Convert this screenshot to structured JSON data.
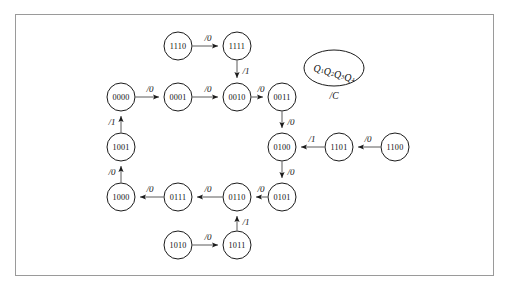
{
  "figure": {
    "type": "state-transition-diagram",
    "border_color": "#9a9a9a",
    "node_stroke": "#1b1b1b",
    "edge_stroke": "#5b5b5b",
    "background": "#ffffff"
  },
  "legend": {
    "state_var_base": "Q",
    "state_var_subscripts": [
      "1",
      "2",
      "3",
      "4"
    ],
    "state_var_label": "Q1Q2Q3Q4",
    "output_label": "/C"
  },
  "nodes": [
    {
      "id": "1110",
      "label": "1110",
      "cx": 178,
      "cy": 46,
      "r": 14
    },
    {
      "id": "1111",
      "label": "1111",
      "cx": 237,
      "cy": 46,
      "r": 14
    },
    {
      "id": "0000",
      "label": "0000",
      "cx": 121,
      "cy": 97,
      "r": 14
    },
    {
      "id": "0001",
      "label": "0001",
      "cx": 178,
      "cy": 97,
      "r": 14
    },
    {
      "id": "0010",
      "label": "0010",
      "cx": 237,
      "cy": 97,
      "r": 14
    },
    {
      "id": "0011",
      "label": "0011",
      "cx": 282,
      "cy": 97,
      "r": 14
    },
    {
      "id": "1001",
      "label": "1001",
      "cx": 121,
      "cy": 147,
      "r": 14
    },
    {
      "id": "0100",
      "label": "0100",
      "cx": 282,
      "cy": 147,
      "r": 14
    },
    {
      "id": "1101",
      "label": "1101",
      "cx": 339,
      "cy": 147,
      "r": 14
    },
    {
      "id": "1100",
      "label": "1100",
      "cx": 395,
      "cy": 147,
      "r": 14
    },
    {
      "id": "1000",
      "label": "1000",
      "cx": 121,
      "cy": 197,
      "r": 14
    },
    {
      "id": "0111",
      "label": "0111",
      "cx": 178,
      "cy": 197,
      "r": 14
    },
    {
      "id": "0110",
      "label": "0110",
      "cx": 237,
      "cy": 197,
      "r": 14
    },
    {
      "id": "0101",
      "label": "0101",
      "cx": 282,
      "cy": 197,
      "r": 14
    },
    {
      "id": "1010",
      "label": "1010",
      "cx": 178,
      "cy": 245,
      "r": 14
    },
    {
      "id": "1011",
      "label": "1011",
      "cx": 237,
      "cy": 245,
      "r": 14
    }
  ],
  "edges": [
    {
      "from": "1110",
      "to": "1111",
      "label": "/0",
      "lx": 208,
      "ly": 38
    },
    {
      "from": "1111",
      "to": "0010",
      "label": "/1",
      "lx": 246,
      "ly": 71
    },
    {
      "from": "0000",
      "to": "0001",
      "label": "/0",
      "lx": 150,
      "ly": 89
    },
    {
      "from": "0001",
      "to": "0010",
      "label": "/0",
      "lx": 208,
      "ly": 89
    },
    {
      "from": "0010",
      "to": "0011",
      "label": "/0",
      "lx": 261,
      "ly": 89
    },
    {
      "from": "0011",
      "to": "0100",
      "label": "/0",
      "lx": 291,
      "ly": 122
    },
    {
      "from": "1101",
      "to": "0100",
      "label": "/1",
      "lx": 312,
      "ly": 139
    },
    {
      "from": "1100",
      "to": "1101",
      "label": "/0",
      "lx": 368,
      "ly": 139
    },
    {
      "from": "0100",
      "to": "0101",
      "label": "/0",
      "lx": 291,
      "ly": 172
    },
    {
      "from": "0101",
      "to": "0110",
      "label": "/0",
      "lx": 261,
      "ly": 189
    },
    {
      "from": "0110",
      "to": "0111",
      "label": "/0",
      "lx": 208,
      "ly": 189
    },
    {
      "from": "0111",
      "to": "1000",
      "label": "/0",
      "lx": 150,
      "ly": 189
    },
    {
      "from": "1000",
      "to": "1001",
      "label": "/0",
      "lx": 112,
      "ly": 172
    },
    {
      "from": "1001",
      "to": "0000",
      "label": "/1",
      "lx": 112,
      "ly": 122
    },
    {
      "from": "1010",
      "to": "1011",
      "label": "/0",
      "lx": 208,
      "ly": 237
    },
    {
      "from": "1011",
      "to": "0110",
      "label": "/1",
      "lx": 246,
      "ly": 222
    }
  ],
  "legend_shape": {
    "cx": 334,
    "cy": 68,
    "rx": 30,
    "ry": 18,
    "out_x": 334,
    "out_y": 96
  }
}
